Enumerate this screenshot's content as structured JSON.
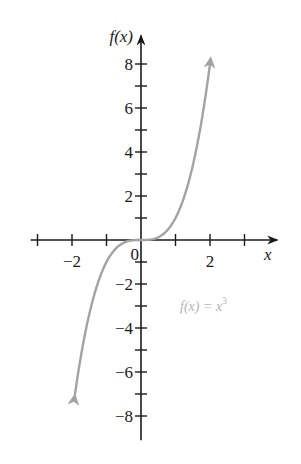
{
  "chart_data": {
    "type": "line",
    "title": "",
    "xlabel": "x",
    "ylabel": "f(x)",
    "function": "x^3",
    "annotation": {
      "text_prefix": "f(x) = x",
      "exponent": "3",
      "x": 1.05,
      "y": -3.0
    },
    "xlim": [
      -3.2,
      3.95
    ],
    "ylim": [
      -9.1,
      9.3
    ],
    "x_ticks": [
      -3,
      -2,
      -1,
      1,
      2,
      3
    ],
    "x_tick_labels": [
      {
        "value": -2,
        "label": "−2"
      },
      {
        "value": 2,
        "label": "2"
      }
    ],
    "origin_label": "0",
    "y_ticks": [
      -8,
      -7,
      -6,
      -5,
      -4,
      -3,
      -2,
      -1,
      1,
      2,
      3,
      4,
      5,
      6,
      7,
      8
    ],
    "y_tick_labels": [
      {
        "value": 8,
        "label": "8"
      },
      {
        "value": 6,
        "label": "6"
      },
      {
        "value": 4,
        "label": "4"
      },
      {
        "value": 2,
        "label": "2"
      },
      {
        "value": -2,
        "label": "−2"
      },
      {
        "value": -4,
        "label": "−4"
      },
      {
        "value": -6,
        "label": "−6"
      },
      {
        "value": -8,
        "label": "−8"
      }
    ],
    "series": [
      {
        "name": "f(x) = x^3",
        "color": "#a3a3a3",
        "x": [
          -1.92,
          -1.75,
          -1.5,
          -1.25,
          -1.0,
          -0.75,
          -0.5,
          -0.25,
          0,
          0.25,
          0.5,
          0.75,
          1.0,
          1.25,
          1.5,
          1.75,
          2.02
        ],
        "y": [
          -8.4,
          -5.36,
          -3.375,
          -1.953,
          -1.0,
          -0.422,
          -0.125,
          -0.016,
          0,
          0.016,
          0.125,
          0.422,
          1.0,
          1.953,
          3.375,
          5.36,
          8.3
        ],
        "arrows": "both"
      }
    ],
    "grid": false,
    "legend": "none"
  },
  "colors": {
    "axis": "#1a1a1a",
    "curve": "#a3a3a3",
    "annotation": "#b5b5b5"
  }
}
